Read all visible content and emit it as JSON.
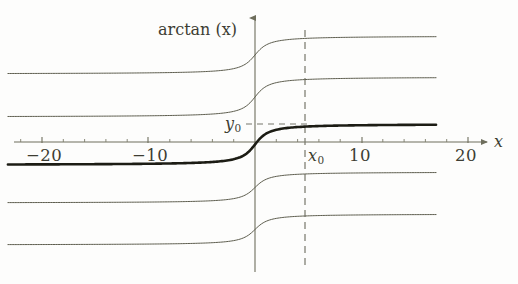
{
  "figure": {
    "title": "arctan (x)",
    "axis_x_label": "x",
    "axis_y_label": "",
    "background_color": "#fdfdfc",
    "curve_color": "#5d5d4e",
    "bold_curve_color": "#1c1c14",
    "axis_color": "#6e6e5c",
    "text_color": "#3d3d33",
    "dash_color": "#77776a"
  },
  "axes": {
    "x_ticks": [
      {
        "value": -20,
        "label": "−20",
        "px": 42
      },
      {
        "value": -10,
        "label": "−10",
        "px": 148
      },
      {
        "value": 0,
        "label": "",
        "px": 255
      },
      {
        "value": 10,
        "label": "10",
        "px": 362
      },
      {
        "value": 20,
        "label": "20",
        "px": 468
      }
    ],
    "x_minor_step": 2,
    "x_range": [
      -24,
      24
    ],
    "x_axis_y_px": 142,
    "y_axis_x_px": 255,
    "y_axis_top_px": 16,
    "y_axis_bottom_px": 272,
    "grid": false,
    "legend": "none"
  },
  "markers": {
    "x0_label": "x",
    "x0_sub": "0",
    "x0_value_px": 305,
    "y0_label": "y",
    "y0_sub": "0",
    "y0_value_px": 124,
    "vertical_dashed_line": true,
    "horizontal_dashed_line": true
  },
  "chart_data": {
    "type": "line",
    "title": "arctan (x)",
    "xlabel": "x",
    "ylabel": "arctan (x)",
    "xlim": [
      -24,
      24
    ],
    "ylim_px": [
      16,
      272
    ],
    "grid": false,
    "legend_position": "none",
    "x": [
      -24,
      -22,
      -20,
      -18,
      -16,
      -14,
      -12,
      -10,
      -8,
      -6,
      -5,
      -4,
      -3,
      -2,
      -1.5,
      -1,
      -0.5,
      0,
      0.5,
      1,
      1.5,
      2,
      3,
      4,
      5,
      6,
      8,
      10,
      12,
      14,
      16
    ],
    "series": [
      {
        "name": "arctan(x) + c1",
        "offset_index": 1,
        "bold": false,
        "left_asymptote_px": 74,
        "right_asymptote_px": 36,
        "center_px": 55
      },
      {
        "name": "arctan(x) + c2",
        "offset_index": 2,
        "bold": false,
        "left_asymptote_px": 117,
        "right_asymptote_px": 77,
        "center_px": 97
      },
      {
        "name": "arctan(x) + c3",
        "offset_index": 3,
        "bold": true,
        "left_asymptote_px": 165,
        "right_asymptote_px": 124,
        "center_px": 144
      },
      {
        "name": "arctan(x) + c4",
        "offset_index": 4,
        "bold": false,
        "left_asymptote_px": 203,
        "right_asymptote_px": 172,
        "center_px": 187
      },
      {
        "name": "arctan(x) + c5",
        "offset_index": 5,
        "bold": false,
        "left_asymptote_px": 245,
        "right_asymptote_px": 214,
        "center_px": 229
      }
    ],
    "annotations": [
      {
        "text": "x₀",
        "kind": "x-marker",
        "x_px": 305,
        "y_px": 155
      },
      {
        "text": "y₀",
        "kind": "y-marker",
        "x_px": 228,
        "y_px": 119
      }
    ]
  }
}
